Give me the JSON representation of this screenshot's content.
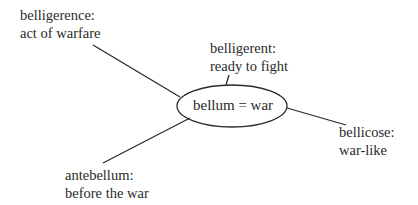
{
  "center": {
    "text": "bellum = war"
  },
  "nodes": [
    {
      "id": "belligerence",
      "line1": "belligerence:",
      "line2": "act of warfare"
    },
    {
      "id": "belligerent",
      "line1": "belligerent:",
      "line2": "ready to fight"
    },
    {
      "id": "bellicose",
      "line1": "bellicose:",
      "line2": "war-like"
    },
    {
      "id": "antebellum",
      "line1": "antebellum:",
      "line2": "before the war"
    }
  ]
}
